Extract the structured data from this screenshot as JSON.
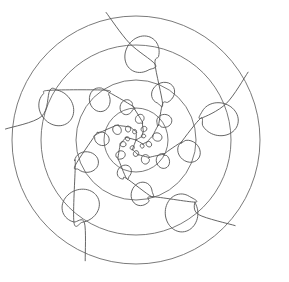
{
  "figure": {
    "type": "line-drawing",
    "width": 289,
    "height": 282,
    "background_color": "#ffffff",
    "stroke_color": "#555555",
    "stroke_width": 0.9,
    "center": {
      "x": 136,
      "y": 140
    }
  },
  "chart_data": {
    "type": "line",
    "xlabel": "",
    "ylabel": "",
    "grid": false,
    "legend": "none",
    "background": "#ffffff",
    "stroke": "#555555",
    "center": {
      "x": 136,
      "y": 140
    },
    "rings": {
      "count": 4,
      "radii": [
        124,
        95,
        60,
        32
      ],
      "stroke": "#6b6b6b",
      "stroke_width": 0.9,
      "fill": "none"
    },
    "spiral": {
      "description": "Five-armed looping spiral; each arm is a curve whose loops shrink logarithmically toward the centre, with a straight tail extending outward past the outermost loop.",
      "arm_count": 5,
      "loops_per_arm": 6,
      "growth_factor": 0.63,
      "outer_loop_radius": 19,
      "inner_loop_radius": 2.2,
      "outer_anchor_radius": 86,
      "rotation_per_loop_deg": 26,
      "arm_start_angles_deg": [
        202,
        274,
        346,
        58,
        130
      ],
      "tail_length": 26,
      "stroke": "#555555",
      "stroke_width": 0.9
    }
  },
  "captions": []
}
